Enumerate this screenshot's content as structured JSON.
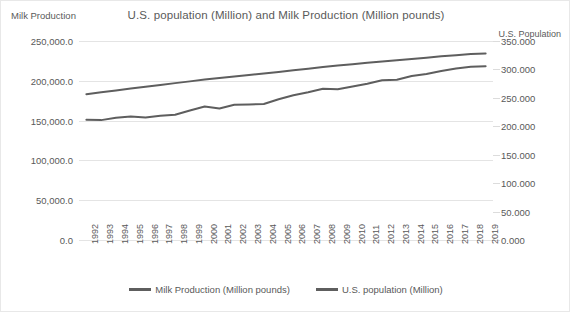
{
  "chart": {
    "title": "U.S. population (Million) and Milk Production (Million pounds)",
    "left_axis_title": "Milk Production",
    "right_axis_title": "U.S. Population"
  },
  "legend": {
    "items": [
      {
        "label": "Milk Production (Million pounds)",
        "color": "#5e5e5e"
      },
      {
        "label": "U.S. population (Million)",
        "color": "#5e5e5e"
      }
    ]
  },
  "chart_data": {
    "type": "line",
    "title": "U.S. population (Million) and Milk Production (Million pounds)",
    "xlabel": "",
    "ylabel": "Milk Production",
    "y2label": "U.S. Population",
    "grid": true,
    "legend_position": "bottom",
    "x": [
      1992,
      1993,
      1994,
      1995,
      1996,
      1997,
      1998,
      1999,
      2000,
      2001,
      2002,
      2003,
      2004,
      2005,
      2006,
      2007,
      2008,
      2009,
      2010,
      2011,
      2012,
      2013,
      2014,
      2015,
      2016,
      2017,
      2018,
      2019
    ],
    "xticklabels": [
      "1992",
      "1993",
      "1994",
      "1995",
      "1996",
      "1997",
      "1998",
      "1999",
      "2000",
      "2001",
      "2002",
      "2003",
      "2004",
      "2005",
      "2006",
      "2007",
      "2008",
      "2009",
      "2010",
      "2011",
      "2012",
      "2013",
      "2014",
      "2015",
      "2016",
      "2017",
      "2018",
      "2019"
    ],
    "ylim": [
      0,
      250000
    ],
    "yticks": [
      0,
      50000,
      100000,
      150000,
      200000,
      250000
    ],
    "yticklabels": [
      "0.0",
      "50,000.0",
      "100,000.0",
      "150,000.0",
      "200,000.0",
      "250,000.0"
    ],
    "y2lim": [
      0,
      350
    ],
    "y2ticks": [
      0,
      50,
      100,
      150,
      200,
      250,
      300,
      350
    ],
    "y2ticklabels": [
      "0.000",
      "50.000",
      "100.000",
      "150.000",
      "200.000",
      "250.000",
      "300.000",
      "350.000"
    ],
    "series": [
      {
        "name": "Milk Production (Million pounds)",
        "axis": "left",
        "color": "#5e5e5e",
        "values": [
          151000,
          150600,
          153600,
          155300,
          154000,
          156100,
          157400,
          162700,
          167600,
          165300,
          169800,
          170300,
          170900,
          176900,
          181800,
          185600,
          190000,
          189300,
          192800,
          196300,
          200600,
          201200,
          206000,
          208600,
          212400,
          215500,
          217600,
          218400
        ]
      },
      {
        "name": "U.S. population (Million)",
        "axis": "right",
        "color": "#5e5e5e",
        "values": [
          256.5,
          259.9,
          263.1,
          266.3,
          269.4,
          272.6,
          275.9,
          279.0,
          282.2,
          285.0,
          287.6,
          290.1,
          292.8,
          295.5,
          298.4,
          301.2,
          304.1,
          306.8,
          309.3,
          311.6,
          313.9,
          316.1,
          318.4,
          320.7,
          323.1,
          325.1,
          327.2,
          328.2
        ]
      }
    ]
  }
}
